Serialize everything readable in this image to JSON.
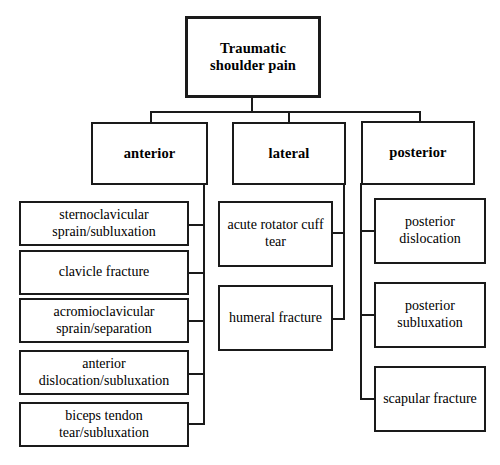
{
  "diagram": {
    "title": "Traumatic shoulder pain",
    "type": "tree-flowchart",
    "root": {
      "label": "Traumatic\nshoulder pain"
    },
    "categories": [
      {
        "label": "anterior",
        "leaves": [
          {
            "label": "sternoclavicular\nsprain/subluxation"
          },
          {
            "label": "clavicle fracture"
          },
          {
            "label": "acromioclavicular\nsprain/separation"
          },
          {
            "label": "anterior\ndislocation/subluxation"
          },
          {
            "label": "biceps tendon\ntear/subluxation"
          }
        ]
      },
      {
        "label": "lateral",
        "leaves": [
          {
            "label": "acute rotator cuff\ntear"
          },
          {
            "label": "humeral fracture"
          }
        ]
      },
      {
        "label": "posterior",
        "leaves": [
          {
            "label": "posterior\ndislocation"
          },
          {
            "label": "posterior\nsubluxation"
          },
          {
            "label": "scapular fracture"
          }
        ]
      }
    ],
    "colors": {
      "background": "#ffffff",
      "stroke": "#1a1a1a",
      "text": "#000000"
    }
  }
}
